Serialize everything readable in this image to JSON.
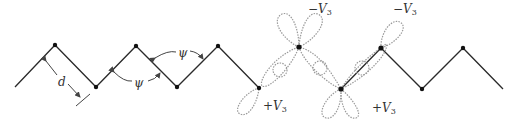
{
  "diagram": {
    "type": "zigzag-chain-with-orbitals",
    "colors": {
      "bond": "#2a2a2a",
      "atom": "#111111",
      "orbital": "#9a9a9a",
      "annotation": "#444444"
    },
    "vertices": [
      [
        15,
        87
      ],
      [
        55,
        45
      ],
      [
        96,
        87
      ],
      [
        136,
        46
      ],
      [
        177,
        87
      ],
      [
        218,
        46
      ],
      [
        259,
        88
      ],
      [
        299,
        47
      ],
      [
        341,
        89
      ],
      [
        381,
        48
      ],
      [
        422,
        89
      ],
      [
        463,
        48
      ],
      [
        503,
        89
      ]
    ],
    "labels": {
      "bond_length": "d",
      "angle_1": "ψ",
      "angle_2": "ψ",
      "minus_v3_1": "−V",
      "minus_v3_1_sub": "3",
      "plus_v3_1": "+V",
      "plus_v3_1_sub": "3",
      "minus_v3_2": "−V",
      "minus_v3_2_sub": "3",
      "plus_v3_2": "+V",
      "plus_v3_2_sub": "3"
    }
  }
}
